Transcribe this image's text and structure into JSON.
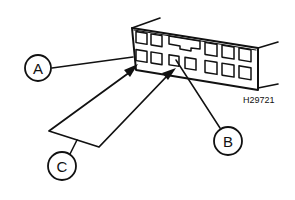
{
  "diagram": {
    "type": "connector-pin-identification",
    "reference_code": "H29721",
    "callouts": [
      {
        "id": "A",
        "label": "A",
        "points_to": "top-left cavity of bottom row"
      },
      {
        "id": "B",
        "label": "B",
        "points_to": "cavity below keyway (bottom row, third)"
      },
      {
        "id": "C",
        "label": "C",
        "points_to": "two cavities (bottom row first and third) via forked arrows"
      }
    ],
    "connector": {
      "rows": 2,
      "top_row_cavities": 6,
      "bottom_row_cavities": 7,
      "has_keyway": true
    },
    "colors": {
      "line": "#111111",
      "background": "#ffffff"
    }
  }
}
